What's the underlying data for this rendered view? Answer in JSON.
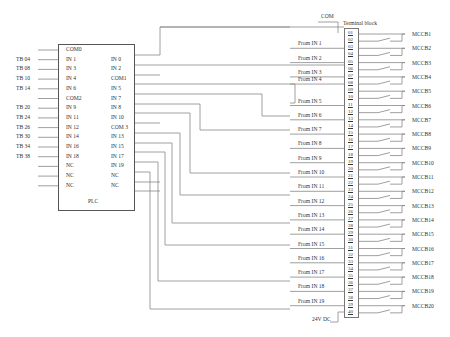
{
  "plc": {
    "title": "PLC",
    "left_pins": [
      "COM0",
      "IN 1",
      "IN 3",
      "IN 4",
      "IN 6",
      "COM2",
      "IN 9",
      "IN 11",
      "IN 12",
      "IN 14",
      "IN 16",
      "IN 18",
      "NC",
      "NC",
      "NC"
    ],
    "right_pins": [
      "",
      "IN 0",
      "IN 2",
      "COM1",
      "IN 5",
      "IN 7",
      "IN 8",
      "IN 10",
      "COM 3",
      "IN 13",
      "IN 15",
      "IN 17",
      "IN 19",
      "NC",
      "NC"
    ]
  },
  "tb_refs": [
    "",
    "TB 04",
    "TB 08",
    "TB 10",
    "TB 14",
    "",
    "TB 20",
    "TB 24",
    "TB 26",
    "TB 30",
    "TB 34",
    "TB 38",
    "",
    "",
    ""
  ],
  "terminal_block": {
    "title": "Terminal block",
    "com_label": "COM",
    "supply_label": "24V DC",
    "terminals": [
      "01",
      "02",
      "03",
      "04",
      "05",
      "06",
      "07",
      "08",
      "09",
      "10",
      "11",
      "12",
      "13",
      "14",
      "15",
      "16",
      "17",
      "18",
      "19",
      "20",
      "21",
      "22",
      "23",
      "24",
      "25",
      "26",
      "27",
      "28",
      "29",
      "30",
      "31",
      "32",
      "33",
      "34",
      "35",
      "36",
      "37",
      "38",
      "39",
      "40"
    ]
  },
  "from_labels": [
    "From IN 1",
    "From IN 2",
    "From IN 3",
    "From IN 4",
    "From IN 5",
    "From IN 6",
    "From IN 7",
    "From IN 8",
    "From IN 9",
    "From IN 10",
    "From IN 11",
    "From IN 12",
    "From IN 13",
    "From IN 14",
    "From IN 15",
    "From IN 16",
    "From IN 17",
    "From IN 18",
    "From IN 19"
  ],
  "breakers": [
    "MCCB1",
    "MCCB2",
    "MCCB3",
    "MCCB4",
    "MCCB5",
    "MCCB6",
    "MCCB7",
    "MCCB8",
    "MCCB9",
    "MCCB10",
    "MCCB11",
    "MCCB12",
    "MCCB13",
    "MCCB14",
    "MCCB15",
    "MCCB16",
    "MCCB17",
    "MCCB18",
    "MCCB19",
    "MCCB20"
  ],
  "colors": {
    "wire": "#888888",
    "box": "#555555",
    "text": "#333333"
  }
}
